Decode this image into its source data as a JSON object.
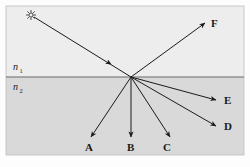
{
  "figure": {
    "media": {
      "upper_label": "n",
      "upper_subscript": "1",
      "lower_label": "n",
      "lower_subscript": "2"
    },
    "source": {
      "icon": "light-source-starburst-icon",
      "x": 31,
      "y": 15
    },
    "incidence_point": {
      "x": 131,
      "y": 77
    },
    "boundary": {
      "y": 77,
      "x1": 6,
      "x2": 244
    },
    "panel": {
      "x": 6,
      "y": 6,
      "width": 238,
      "height": 149
    },
    "colors": {
      "upper_medium": "#ececec",
      "lower_medium": "#d8d8d8",
      "ray": "#1a1a1a",
      "boundary_line": "#555555",
      "panel_border": "#b0b0b0"
    },
    "rays": [
      {
        "name": "incident-ray",
        "label": "",
        "from": [
          31,
          15
        ],
        "to": [
          131,
          77
        ],
        "arrow_at": [
          107,
          62
        ]
      },
      {
        "name": "ray-F",
        "label": "F",
        "from": [
          131,
          77
        ],
        "to": [
          205,
          23
        ],
        "label_x": 211,
        "label_y": 27
      },
      {
        "name": "ray-E",
        "label": "E",
        "from": [
          131,
          77
        ],
        "to": [
          216,
          100
        ],
        "label_x": 224,
        "label_y": 104
      },
      {
        "name": "ray-D",
        "label": "D",
        "from": [
          131,
          77
        ],
        "to": [
          216,
          126
        ],
        "label_x": 224,
        "label_y": 130
      },
      {
        "name": "ray-C",
        "label": "C",
        "from": [
          131,
          77
        ],
        "to": [
          170,
          137
        ],
        "label_x": 163,
        "label_y": 151
      },
      {
        "name": "ray-B",
        "label": "B",
        "from": [
          131,
          77
        ],
        "to": [
          131,
          137
        ],
        "label_x": 127,
        "label_y": 151
      },
      {
        "name": "ray-A",
        "label": "A",
        "from": [
          131,
          77
        ],
        "to": [
          91,
          137
        ],
        "label_x": 85,
        "label_y": 151
      }
    ]
  }
}
